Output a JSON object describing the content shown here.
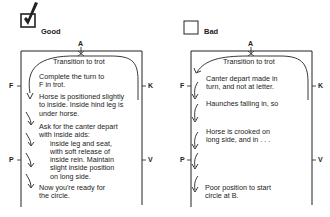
{
  "good": {
    "heading": "Good",
    "letters": {
      "top": "A",
      "left1": "F",
      "right1": "K",
      "left2": "P",
      "right2": "V"
    },
    "transition": "Transition to trot",
    "steps": [
      {
        "lines": [
          "Complete the turn to",
          "F in trot."
        ]
      },
      {
        "lines": [
          "Horse is positioned slightly",
          "to inside. Inside hind leg is",
          "under horse."
        ]
      },
      {
        "lines": [
          "Ask for the canter depart",
          "with inside aids:"
        ],
        "indented": [
          "inside leg and seat,",
          "with soft release of",
          "inside rein. Maintain",
          "slight inside position",
          "on long side."
        ]
      },
      {
        "lines": [
          "Now you're ready for",
          "the circle."
        ]
      }
    ]
  },
  "bad": {
    "heading": "Bad",
    "letters": {
      "top": "A",
      "left1": "F",
      "right1": "K",
      "left2": "P",
      "right2": "V"
    },
    "transition": "Transition to trot",
    "steps": [
      {
        "lines": [
          "Canter depart made in",
          "turn, and not at letter."
        ]
      },
      {
        "lines": [
          "Haunches falling in, so"
        ]
      },
      {
        "lines": [
          "Horse is crooked on",
          "long side, and in . . ."
        ]
      },
      {
        "lines": [
          "Poor position to start",
          "circle at B."
        ]
      }
    ]
  },
  "colors": {
    "ink": "#222222",
    "background": "#ffffff"
  }
}
